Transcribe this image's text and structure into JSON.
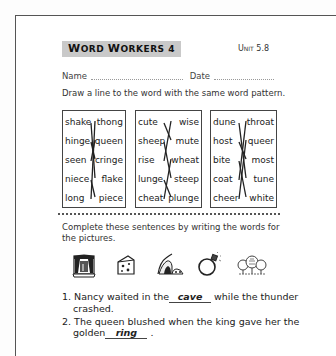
{
  "header": {
    "title_first": "W",
    "title_rest": "ORD ",
    "title_second": "W",
    "title_rest2": "ORKERS 4",
    "title": "Word Workers 4",
    "unit": "Unit 5.8"
  },
  "form": {
    "name_label": "Name",
    "date_label": "Date"
  },
  "part1": {
    "instruction": "Draw a line to the word with the same word pattern.",
    "boxes": [
      {
        "left": [
          "shake",
          "hinge",
          "seen",
          "niece",
          "long"
        ],
        "right": [
          "thong",
          "queen",
          "cringe",
          "flake",
          "piece"
        ],
        "matches": [
          [
            0,
            3
          ],
          [
            1,
            2
          ],
          [
            2,
            1
          ],
          [
            3,
            4
          ],
          [
            4,
            0
          ]
        ]
      },
      {
        "left": [
          "cute",
          "sheep",
          "rise",
          "lunge",
          "cheat"
        ],
        "right": [
          "wise",
          "mute",
          "wheat",
          "steep",
          "plunge"
        ],
        "matches": [
          [
            0,
            1
          ],
          [
            1,
            3
          ],
          [
            2,
            0
          ],
          [
            3,
            4
          ],
          [
            4,
            2
          ]
        ]
      },
      {
        "left": [
          "dune",
          "host",
          "bite",
          "coat",
          "cheer"
        ],
        "right": [
          "throat",
          "queer",
          "most",
          "tune",
          "white"
        ],
        "matches": [
          [
            0,
            3
          ],
          [
            1,
            2
          ],
          [
            2,
            4
          ],
          [
            3,
            0
          ],
          [
            4,
            1
          ]
        ]
      }
    ]
  },
  "part2": {
    "instruction": "Complete these sentences by writing the words for the pictures.",
    "pictures": [
      "stage-picture",
      "cheese-picture",
      "cave-picture",
      "ring-picture",
      "trees-picture"
    ],
    "sentences": [
      {
        "num": "1.",
        "before": "Nancy waited in the",
        "answer": "cave",
        "after": "while the thunder",
        "line2": "crashed."
      },
      {
        "num": "2.",
        "before": "The queen blushed when the king gave her the",
        "line2_before": "golden",
        "answer": "ring",
        "after": "."
      }
    ]
  }
}
